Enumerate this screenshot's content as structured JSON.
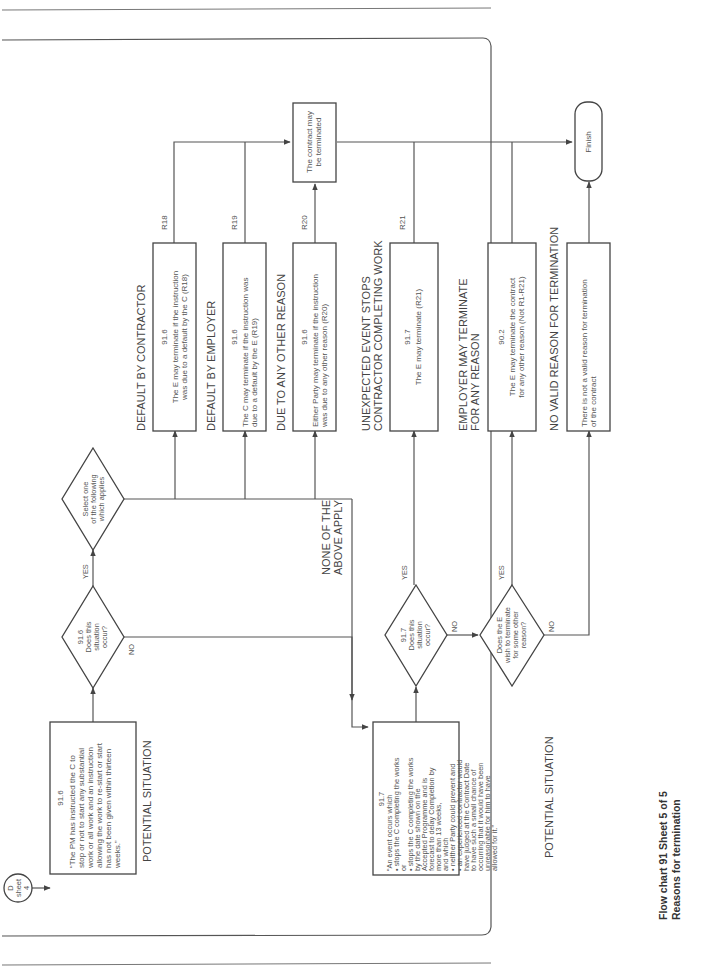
{
  "page": {
    "running_header": "",
    "caption_line1": "Flow chart 91   Sheet 5 of 5",
    "caption_line2": "Reasons for termination"
  },
  "connector": {
    "line1": "D",
    "line2": "sheet",
    "line3": "4"
  },
  "situation_916": {
    "clause": "91.6",
    "lines": [
      "“The PM has instructed the C to",
      "stop or not to start any substantial",
      "work or all work and an instruction",
      "allowing the work to re-start or start",
      "has not been given within thirteen",
      "weeks.”"
    ],
    "label": "POTENTIAL SITUATION"
  },
  "decision_916": {
    "lines": [
      "91.6",
      "Does this",
      "situation",
      "occur?"
    ],
    "yes": "YES",
    "no": "NO"
  },
  "decision_select": {
    "lines": [
      "Select one",
      "of the following",
      "which applies"
    ]
  },
  "none_apply": {
    "line1": "NONE OF THE",
    "line2": "ABOVE APPLY"
  },
  "outcomes": [
    {
      "heading": [
        "DEFAULT BY CONTRACTOR"
      ],
      "clause": "91.6",
      "lines": [
        "The E may terminate if the instruction",
        "was due to a default by the C (R18)"
      ],
      "ref": "R18"
    },
    {
      "heading": [
        "DEFAULT BY EMPLOYER"
      ],
      "clause": "91.6",
      "lines": [
        "The C may terminate if the instruction was",
        "due to a default by the E (R19)"
      ],
      "ref": "R19"
    },
    {
      "heading": [
        "DUE TO ANY OTHER REASON"
      ],
      "clause": "91.6",
      "lines": [
        "Either Party may terminate if the instruction",
        "was due to any other reason (R20)"
      ],
      "ref": "R20"
    },
    {
      "heading": [
        "UNEXPECTED EVENT STOPS",
        "CONTRACTOR COMPLETING WORK"
      ],
      "clause": "91.7",
      "lines": [
        "The E may terminate (R21)"
      ],
      "ref": "R21"
    },
    {
      "heading": [
        "EMPLOYER MAY TERMINATE",
        "FOR ANY REASON"
      ],
      "clause": "90.2",
      "lines": [
        "The E may terminate the contract",
        "for any other reason (Not R1-R21)"
      ],
      "ref": ""
    },
    {
      "heading": [
        "NO VALID REASON FOR TERMINATION"
      ],
      "clause": "",
      "lines": [
        "There is not a valid reason for termination",
        "of the contract"
      ],
      "ref": ""
    }
  ],
  "contract_terminated": {
    "lines": [
      "The contract may",
      "be terminated"
    ]
  },
  "finish": {
    "label": "Finish"
  },
  "situation_917": {
    "clause": "91.7",
    "lines": [
      "“An event occurs which",
      "• stops the C completing the works",
      "   or",
      "• stops the C completing the works",
      "   by the date shown on the",
      "   Accepted Programme and is",
      "   forecast to delay Completion by",
      "   more than 13 weeks,",
      "and which",
      "• neither Party could prevent and",
      "• an experienced contractor would",
      "   have judged at the Contract Date",
      "   to have such a small chance of",
      "   occurring that it would have been",
      "   unreasonable for him to have",
      "   allowed for it.”"
    ],
    "label": "POTENTIAL SITUATION"
  },
  "decision_917": {
    "lines": [
      "91.7",
      "Does this",
      "situation",
      "occur?"
    ],
    "yes": "YES",
    "no": "NO"
  },
  "decision_other": {
    "lines": [
      "Does the E",
      "wish to terminate",
      "for some other",
      "reason?"
    ],
    "yes": "YES",
    "no": "NO"
  },
  "colors": {
    "line": "#555555",
    "text": "#555555",
    "background": "#ffffff"
  }
}
